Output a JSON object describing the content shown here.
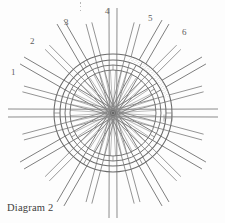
{
  "figure": {
    "caption": "Diagram 2",
    "title": "Diagram 2",
    "type": "technical-line-drawing",
    "colors": {
      "line": "#6b6b6b",
      "line_light": "#9a9a9a",
      "stipple": "#8d8d8d",
      "text": "#5e5e5e",
      "caption_text": "#3d3d3d",
      "background": "#fdfdfd"
    },
    "geometry": {
      "center_x": 113,
      "center_y": 113,
      "hub_radius": 3,
      "inner_ring_outer_radius": 48,
      "inner_ring_inner_radius": 43,
      "outer_ring_outer_radius": 59,
      "outer_ring_inner_radius": 53,
      "spoke_count": 24,
      "long_beam_count": 12,
      "beam_outer_radius": 105
    },
    "shaded_segment": {
      "label": "stippled-arc-segment",
      "start_angle_deg": -76,
      "end_angle_deg": -16,
      "fill": "stipple-texture"
    },
    "dimension_mark": {
      "label": "detail-tick-mark",
      "x": 168,
      "y": 118
    }
  },
  "callouts": [
    {
      "id": "1",
      "label": "1",
      "x": 11,
      "y": 68
    },
    {
      "id": "2",
      "label": "2",
      "x": 30,
      "y": 37
    },
    {
      "id": "3",
      "label": "3",
      "x": 64,
      "y": 18
    },
    {
      "id": "4",
      "label": "4",
      "x": 105,
      "y": 7
    },
    {
      "id": "5",
      "label": "5",
      "x": 148,
      "y": 14
    },
    {
      "id": "6",
      "label": "6",
      "x": 182,
      "y": 28
    }
  ],
  "marks": {
    "ellipsis": "⋮"
  }
}
